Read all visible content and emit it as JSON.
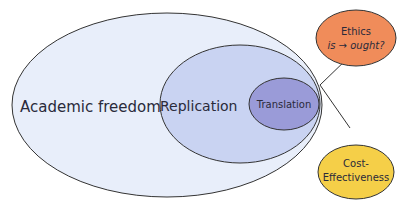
{
  "diagram": {
    "nested_sets": [
      {
        "id": "academic-freedom",
        "label": "Academic freedom",
        "fill": "#e8eefa"
      },
      {
        "id": "replication",
        "label": "Replication",
        "fill": "#c9d3f2"
      },
      {
        "id": "translation",
        "label": "Translation",
        "fill": "#9a9bd8"
      }
    ],
    "callouts": [
      {
        "id": "ethics",
        "line1": "Ethics",
        "line2_a": "is",
        "line2_arrow": "→",
        "line2_b": "ought?",
        "fill": "#f08c5a"
      },
      {
        "id": "cost-effectiveness",
        "line1": "Cost-",
        "line2": "Effectiveness",
        "fill": "#f5cf48"
      }
    ],
    "stroke_color": "#333333"
  }
}
